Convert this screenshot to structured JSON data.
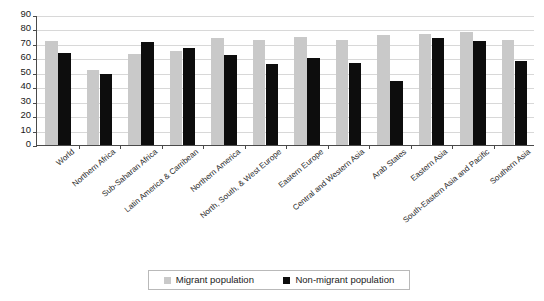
{
  "chart_data": {
    "type": "bar",
    "title": "",
    "subtitle": "",
    "xlabel": "",
    "ylabel": "",
    "ylim": [
      0,
      90
    ],
    "ytick_step": 10,
    "yticks": [
      90,
      80,
      70,
      60,
      50,
      40,
      30,
      20,
      10,
      0
    ],
    "grid": true,
    "legend_position": "bottom",
    "categories": [
      "World",
      "Northern Africa",
      "Sub-Saharan Africa",
      "Latin America & Carribean",
      "Northern America",
      "North, South, & West Europe",
      "Eastern Europe",
      "Central and Western Asia",
      "Arab States",
      "Eastern Asia",
      "South-Eastern Asia and Pacific",
      "Southern Asia"
    ],
    "series": [
      {
        "name": "Migrant population",
        "color": "#c9c9c9",
        "values": [
          72,
          52,
          63,
          65,
          74,
          73,
          75,
          73,
          76,
          77,
          78,
          73
        ]
      },
      {
        "name": "Non-migrant population",
        "color": "#0d0d0d",
        "values": [
          64,
          49,
          71,
          67,
          62,
          56,
          60,
          57,
          44,
          74,
          72,
          58
        ]
      }
    ]
  },
  "legend": {
    "items": [
      {
        "label": "Migrant population",
        "swatch": "migrant-swatch"
      },
      {
        "label": "Non-migrant population",
        "swatch": "non-migrant-swatch"
      }
    ]
  },
  "colors": {
    "migrant": "#c9c9c9",
    "non_migrant": "#0d0d0d",
    "axis": "#4a4a4a",
    "gridline": "#d8d8d8",
    "background": "#ffffff"
  }
}
